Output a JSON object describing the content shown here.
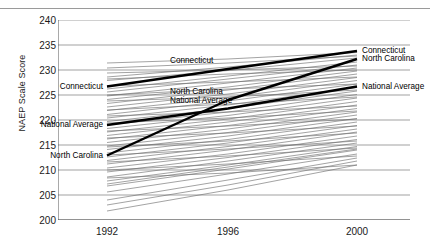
{
  "chart_data": {
    "type": "line",
    "title": "",
    "xlabel": "",
    "ylabel": "NAEP Scale Score",
    "x": [
      "1992",
      "1996",
      "2000"
    ],
    "xtick_labels": [
      "1992",
      "1996",
      "2000"
    ],
    "ytick_labels": [
      "200",
      "205",
      "210",
      "215",
      "220",
      "225",
      "230",
      "235",
      "240"
    ],
    "ytick_values": [
      200,
      205,
      210,
      215,
      220,
      225,
      230,
      235,
      240
    ],
    "ylim": [
      200,
      240
    ],
    "grid": "horizontal",
    "legend_position": "inline-annotations",
    "annotations": [
      {
        "text": "Connecticut",
        "anchor": "left",
        "series": "Connecticut",
        "at_x": "1992"
      },
      {
        "text": "National Average",
        "anchor": "left",
        "series": "National Average",
        "at_x": "1992"
      },
      {
        "text": "North Carolina",
        "anchor": "left",
        "series": "North Carolina",
        "at_x": "1992"
      },
      {
        "text": "Connecticut",
        "anchor": "mid",
        "series": "Connecticut",
        "at_x": "1996"
      },
      {
        "text": "North Carolina",
        "anchor": "mid",
        "series": "North Carolina",
        "at_x": "1996"
      },
      {
        "text": "National Average",
        "anchor": "mid",
        "series": "National Average",
        "at_x": "1996"
      },
      {
        "text": "Connecticut",
        "anchor": "right",
        "series": "Connecticut",
        "at_x": "2000"
      },
      {
        "text": "North Carolina",
        "anchor": "right",
        "series": "North Carolina",
        "at_x": "2000"
      },
      {
        "text": "National Average",
        "anchor": "right",
        "series": "National Average",
        "at_x": "2000"
      }
    ],
    "highlighted_series": [
      {
        "name": "Connecticut",
        "values": [
          226.7,
          230.2,
          233.8
        ],
        "emphasis": "bold"
      },
      {
        "name": "North Carolina",
        "values": [
          212.9,
          224.0,
          232.2
        ],
        "emphasis": "bold"
      },
      {
        "name": "National Average",
        "values": [
          219.0,
          222.3,
          226.7
        ],
        "emphasis": "bold"
      }
    ],
    "background_series": [
      {
        "name": "state-01",
        "values": [
          231.4,
          232.2,
          233.5
        ]
      },
      {
        "name": "state-02",
        "values": [
          228.6,
          230.6,
          233.0
        ]
      },
      {
        "name": "state-03",
        "values": [
          227.9,
          229.9,
          232.4
        ]
      },
      {
        "name": "state-04",
        "values": [
          226.2,
          228.8,
          231.6
        ]
      },
      {
        "name": "state-05",
        "values": [
          225.6,
          228.2,
          231.0
        ]
      },
      {
        "name": "state-06",
        "values": [
          224.8,
          227.4,
          230.4
        ]
      },
      {
        "name": "state-07",
        "values": [
          224.1,
          226.6,
          229.8
        ]
      },
      {
        "name": "state-08",
        "values": [
          223.3,
          226.0,
          229.2
        ]
      },
      {
        "name": "state-09",
        "values": [
          222.6,
          225.2,
          228.5
        ]
      },
      {
        "name": "state-10",
        "values": [
          221.9,
          224.5,
          227.9
        ]
      },
      {
        "name": "state-11",
        "values": [
          221.1,
          223.8,
          227.2
        ]
      },
      {
        "name": "state-12",
        "values": [
          220.4,
          223.0,
          226.5
        ]
      },
      {
        "name": "state-13",
        "values": [
          219.7,
          222.3,
          225.8
        ]
      },
      {
        "name": "state-14",
        "values": [
          219.0,
          221.6,
          225.1
        ]
      },
      {
        "name": "state-15",
        "values": [
          218.3,
          220.9,
          224.4
        ]
      },
      {
        "name": "state-16",
        "values": [
          217.6,
          220.2,
          223.7
        ]
      },
      {
        "name": "state-17",
        "values": [
          216.9,
          219.6,
          223.0
        ]
      },
      {
        "name": "state-18",
        "values": [
          216.2,
          218.9,
          222.3
        ]
      },
      {
        "name": "state-19",
        "values": [
          215.5,
          218.2,
          221.6
        ]
      },
      {
        "name": "state-20",
        "values": [
          214.8,
          217.5,
          221.0
        ]
      },
      {
        "name": "state-21",
        "values": [
          214.1,
          216.8,
          220.3
        ]
      },
      {
        "name": "state-22",
        "values": [
          213.4,
          216.1,
          219.6
        ]
      },
      {
        "name": "state-23",
        "values": [
          212.6,
          215.4,
          218.9
        ]
      },
      {
        "name": "state-24",
        "values": [
          211.9,
          214.7,
          218.2
        ]
      },
      {
        "name": "state-25",
        "values": [
          211.2,
          214.0,
          217.6
        ]
      },
      {
        "name": "state-26",
        "values": [
          210.4,
          213.2,
          216.8
        ]
      },
      {
        "name": "state-27",
        "values": [
          209.6,
          212.5,
          216.1
        ]
      },
      {
        "name": "state-28",
        "values": [
          208.6,
          211.8,
          215.4
        ]
      },
      {
        "name": "state-29",
        "values": [
          207.8,
          211.0,
          214.7
        ]
      },
      {
        "name": "state-30",
        "values": [
          206.8,
          210.2,
          214.0
        ]
      },
      {
        "name": "state-31",
        "values": [
          205.6,
          209.2,
          213.2
        ]
      },
      {
        "name": "state-32",
        "values": [
          204.0,
          208.0,
          212.4
        ]
      },
      {
        "name": "state-33",
        "values": [
          201.8,
          206.0,
          211.0
        ]
      },
      {
        "name": "state-34",
        "values": [
          229.4,
          230.0,
          230.8
        ]
      },
      {
        "name": "state-35",
        "values": [
          226.8,
          227.6,
          228.6
        ]
      },
      {
        "name": "state-36",
        "values": [
          223.8,
          224.6,
          226.0
        ]
      },
      {
        "name": "state-37",
        "values": [
          220.8,
          221.6,
          222.8
        ]
      },
      {
        "name": "state-38",
        "values": [
          217.8,
          218.8,
          220.2
        ]
      },
      {
        "name": "state-39",
        "values": [
          214.6,
          215.8,
          217.4
        ]
      },
      {
        "name": "state-40",
        "values": [
          211.6,
          212.8,
          214.4
        ]
      },
      {
        "name": "state-41",
        "values": [
          208.4,
          209.4,
          211.0
        ]
      },
      {
        "name": "state-42",
        "values": [
          228.2,
          229.2,
          230.0
        ]
      },
      {
        "name": "state-43",
        "values": [
          225.0,
          226.2,
          227.2
        ]
      },
      {
        "name": "state-44",
        "values": [
          222.0,
          223.2,
          224.6
        ]
      },
      {
        "name": "state-45",
        "values": [
          219.4,
          220.4,
          221.8
        ]
      },
      {
        "name": "state-46",
        "values": [
          216.4,
          217.4,
          218.8
        ]
      },
      {
        "name": "state-47",
        "values": [
          213.0,
          214.2,
          215.8
        ]
      },
      {
        "name": "state-48",
        "values": [
          210.0,
          211.2,
          212.8
        ]
      },
      {
        "name": "state-49",
        "values": [
          203.0,
          207.0,
          211.8
        ]
      },
      {
        "name": "state-50",
        "values": [
          230.4,
          231.4,
          232.8
        ]
      },
      {
        "name": "state-51",
        "values": [
          207.2,
          210.6,
          214.2
        ]
      }
    ],
    "colors": {
      "axis": "#555555",
      "grid": "#7a7a7a",
      "background_line": "#6e6e6e",
      "highlight_line": "#000000",
      "text": "#1a1a1a",
      "background": "#ffffff"
    }
  }
}
